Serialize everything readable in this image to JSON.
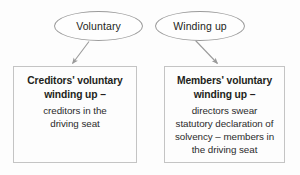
{
  "diagram": {
    "colors": {
      "background": "#fdfdfd",
      "ellipse_stroke": "#9b9b9b",
      "box_stroke": "#c4c4c4",
      "arrow_stroke": "#9a9a9a",
      "text": "#231f20"
    },
    "nodes": {
      "ellipse_voluntary": {
        "label": "Voluntary",
        "shape": "ellipse"
      },
      "ellipse_winding_up": {
        "label": "Winding up",
        "shape": "ellipse"
      },
      "box_creditors": {
        "shape": "rectangle",
        "heading_line_1": "Creditors' voluntary",
        "heading_line_2": "winding up –",
        "body_line_1": "creditors in the",
        "body_line_2": "driving seat",
        "body_line_3": "",
        "body_line_4": ""
      },
      "box_members": {
        "shape": "rectangle",
        "heading_line_1": "Members' voluntary",
        "heading_line_2": "winding up –",
        "body_line_1": "directors swear",
        "body_line_2": "statutory declaration of",
        "body_line_3": "solvency – members in",
        "body_line_4": "the driving seat"
      }
    },
    "edges": [
      {
        "name": "arrow-voluntary-to-creditors",
        "from": "ellipse_voluntary",
        "to": "box_creditors",
        "kind": "arrow"
      },
      {
        "name": "arrow-winding-up-to-members",
        "from": "ellipse_winding_up",
        "to": "box_members",
        "kind": "arrow"
      }
    ]
  }
}
